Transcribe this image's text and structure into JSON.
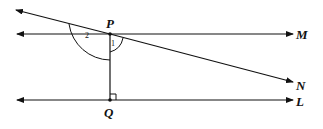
{
  "diagram": {
    "labels": {
      "P": "P",
      "Q": "Q",
      "M": "M",
      "N": "N",
      "L": "L",
      "angle1": "1",
      "angle2": "2"
    },
    "elements": [
      {
        "name": "line-PM",
        "description": "horizontal line through P with arrows both ends, ending at M"
      },
      {
        "name": "line-QL",
        "description": "horizontal line through Q with arrows both ends, ending at L"
      },
      {
        "name": "transversal-PN",
        "description": "slanted line through P, ending at N"
      },
      {
        "name": "segment-PQ",
        "description": "vertical segment from P to Q, perpendicular to QL"
      },
      {
        "name": "right-angle-mark",
        "description": "at Q"
      },
      {
        "name": "angle-1-arc",
        "description": "small arc at P between PQ and PN"
      },
      {
        "name": "angle-2-arc",
        "description": "large arc at P from transversal to PQ"
      }
    ],
    "colors": {
      "stroke": "#111111",
      "background": "#ffffff"
    }
  }
}
